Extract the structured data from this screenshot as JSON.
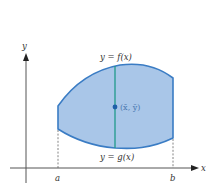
{
  "diagram": {
    "type": "centroid-region",
    "axes": {
      "x_label": "x",
      "y_label": "y"
    },
    "bounds": {
      "left_label": "a",
      "right_label": "b"
    },
    "curves": {
      "top_label": "y = f(x)",
      "bottom_label": "y = g(x)"
    },
    "centroid_label": "(x̄, ȳ)",
    "colors": {
      "region_fill": "#a9c6e8",
      "region_stroke": "#3a7cc4",
      "strip_line": "#1f9a8a",
      "centroid_dot": "#1f5fa8",
      "axis": "#555555",
      "dashed": "#666666"
    }
  }
}
